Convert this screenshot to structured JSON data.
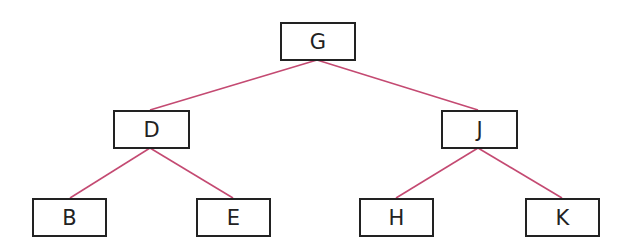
{
  "diagram": {
    "type": "binary-tree",
    "edge_color": "#c44a72",
    "border_color": "#222222",
    "nodes": [
      {
        "id": "G",
        "label": "G",
        "x": 280,
        "y": 22,
        "w": 76,
        "h": 39
      },
      {
        "id": "D",
        "label": "D",
        "x": 113,
        "y": 110,
        "w": 77,
        "h": 39
      },
      {
        "id": "J",
        "label": "J",
        "x": 441,
        "y": 110,
        "w": 77,
        "h": 39
      },
      {
        "id": "B",
        "label": "B",
        "x": 32,
        "y": 198,
        "w": 75,
        "h": 39
      },
      {
        "id": "E",
        "label": "E",
        "x": 196,
        "y": 198,
        "w": 75,
        "h": 39
      },
      {
        "id": "H",
        "label": "H",
        "x": 359,
        "y": 198,
        "w": 75,
        "h": 39
      },
      {
        "id": "K",
        "label": "K",
        "x": 525,
        "y": 198,
        "w": 75,
        "h": 39
      }
    ],
    "edges": [
      {
        "from": "G",
        "to": "D"
      },
      {
        "from": "G",
        "to": "J"
      },
      {
        "from": "D",
        "to": "B"
      },
      {
        "from": "D",
        "to": "E"
      },
      {
        "from": "J",
        "to": "H"
      },
      {
        "from": "J",
        "to": "K"
      }
    ]
  }
}
